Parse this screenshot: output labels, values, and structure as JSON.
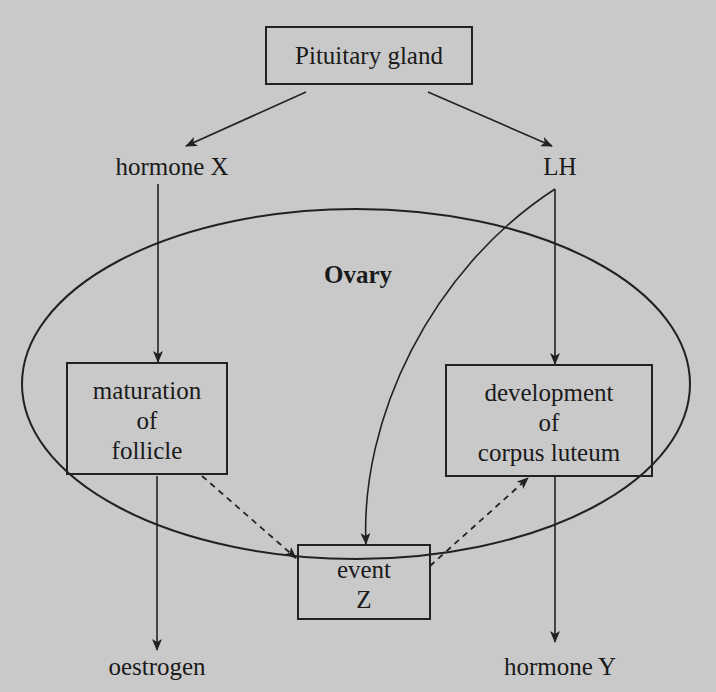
{
  "diagram": {
    "colors": {
      "background": "#c9c9c9",
      "ink": "#1a1a1a"
    },
    "nodes": {
      "pituitary": {
        "label": "Pituitary gland",
        "boxed": true
      },
      "hormone_x": {
        "label": "hormone X",
        "boxed": false
      },
      "lh": {
        "label": "LH",
        "boxed": false
      },
      "ovary": {
        "label": "Ovary",
        "shape": "ellipse",
        "bold": true
      },
      "maturation": {
        "lines": [
          "maturation",
          "of",
          "follicle"
        ],
        "boxed": true
      },
      "development": {
        "lines": [
          "development",
          "of",
          "corpus luteum"
        ],
        "boxed": true
      },
      "event_z": {
        "lines": [
          "event",
          "Z"
        ],
        "boxed": true
      },
      "oestrogen": {
        "label": "oestrogen",
        "boxed": false
      },
      "hormone_y": {
        "label": "hormone Y",
        "boxed": false
      }
    },
    "edges": [
      {
        "from": "Pituitary gland",
        "to": "hormone X",
        "style": "solid"
      },
      {
        "from": "Pituitary gland",
        "to": "LH",
        "style": "solid"
      },
      {
        "from": "hormone X",
        "to": "maturation of follicle",
        "style": "solid"
      },
      {
        "from": "LH",
        "to": "development of corpus luteum",
        "style": "solid"
      },
      {
        "from": "LH",
        "to": "event Z",
        "style": "solid-curved"
      },
      {
        "from": "maturation of follicle",
        "to": "event Z",
        "style": "dashed"
      },
      {
        "from": "event Z",
        "to": "development of corpus luteum",
        "style": "dashed"
      },
      {
        "from": "maturation of follicle",
        "to": "oestrogen",
        "style": "solid"
      },
      {
        "from": "development of corpus luteum",
        "to": "hormone Y",
        "style": "solid"
      }
    ]
  }
}
